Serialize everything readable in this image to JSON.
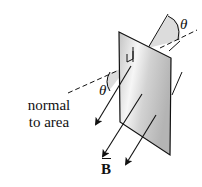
{
  "diagram": {
    "type": "magnetic-flux-through-tilted-area",
    "labels": {
      "theta_top": "θ",
      "theta_left": "θ",
      "normal_line1": "normal",
      "normal_line2": "to area",
      "field": "B"
    },
    "colors": {
      "stroke": "#111111",
      "plate_light": "#f4f4f4",
      "plate_dark": "#bdbdbd",
      "wedge_fill": "#d9d9d9",
      "background": "#ffffff"
    }
  }
}
